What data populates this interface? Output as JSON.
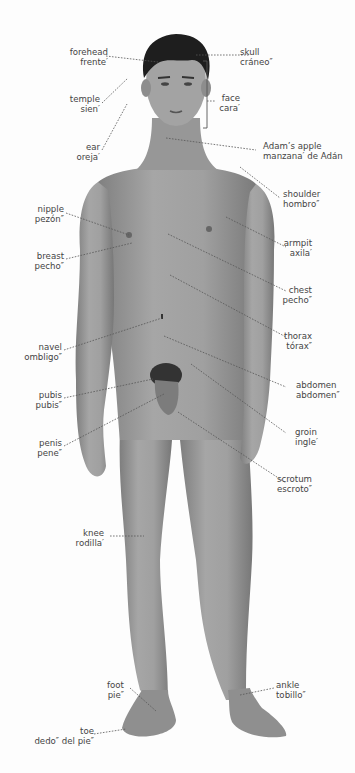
{
  "diagram": {
    "type": "anatomy-labeled-figure",
    "skin_color": "#9a9a9a",
    "hair_color": "#1e1e1e",
    "leader_line_color": "#555555",
    "labels": [
      {
        "id": "forehead",
        "en": "forehead",
        "es": "frente′"
      },
      {
        "id": "temple",
        "en": "temple",
        "es": "sien′"
      },
      {
        "id": "ear",
        "en": "ear",
        "es": "oreja′"
      },
      {
        "id": "skull",
        "en": "skull",
        "es": "cráneo″"
      },
      {
        "id": "face",
        "en": "face",
        "es": "cara′"
      },
      {
        "id": "adams-apple",
        "en": "Adam’s apple",
        "es": "manzana′ de Adán"
      },
      {
        "id": "shoulder",
        "en": "shoulder",
        "es": "hombro″"
      },
      {
        "id": "nipple",
        "en": "nipple",
        "es": "pezón″"
      },
      {
        "id": "breast",
        "en": "breast",
        "es": "pecho″"
      },
      {
        "id": "armpit",
        "en": "armpit",
        "es": "axila′"
      },
      {
        "id": "chest",
        "en": "chest",
        "es": "pecho″"
      },
      {
        "id": "thorax",
        "en": "thorax",
        "es": "tórax″"
      },
      {
        "id": "navel",
        "en": "navel",
        "es": "ombligo″"
      },
      {
        "id": "abdomen",
        "en": "abdomen",
        "es": "abdomen″"
      },
      {
        "id": "pubis",
        "en": "pubis",
        "es": "pubis″"
      },
      {
        "id": "groin",
        "en": "groin",
        "es": "ingle′"
      },
      {
        "id": "penis",
        "en": "penis",
        "es": "pene″"
      },
      {
        "id": "scrotum",
        "en": "scrotum",
        "es": "escroto″"
      },
      {
        "id": "knee",
        "en": "knee",
        "es": "rodilla′"
      },
      {
        "id": "foot",
        "en": "foot",
        "es": "pie″"
      },
      {
        "id": "ankle",
        "en": "ankle",
        "es": "tobillo″"
      },
      {
        "id": "toe",
        "en": "toe",
        "es": "dedo″ del pie″"
      }
    ]
  }
}
